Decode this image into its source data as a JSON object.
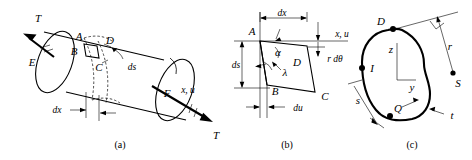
{
  "figure": {
    "ink_color": "#000000",
    "background_color": "#ffffff",
    "panels": [
      {
        "id": "a",
        "caption": "(a)",
        "description": "Thin-walled cylindrical tube under torque with a surface element ABCD",
        "labels": {
          "torque_left": "T",
          "torque_right": "T",
          "end_near": "E",
          "end_far": "F",
          "element_a": "A",
          "element_b": "B",
          "element_c": "C",
          "element_d": "D",
          "arc_length": "ds",
          "axial_length": "dx",
          "axis": "x, u"
        }
      },
      {
        "id": "b",
        "caption": "(b)",
        "description": "Deformed element ABCD in the developed x-s plane",
        "labels": {
          "corner_a": "A",
          "corner_b": "B",
          "corner_c": "C",
          "corner_d": "D",
          "axis": "x, u",
          "width": "dx",
          "height": "ds",
          "shear_angle": "α",
          "rotation_angle": "λ",
          "tangential_displacement": "r dθ",
          "axial_displacement": "du"
        }
      },
      {
        "id": "c",
        "caption": "(c)",
        "description": "Closed thin-walled cross-section with tangent, perpendicular distance r from shear center S",
        "labels": {
          "point_d": "D",
          "point_i": "I",
          "point_q": "Q",
          "point_s": "S",
          "axis_z": "z",
          "axis_y": "y",
          "perpendicular_distance": "r",
          "arc_coordinate": "s",
          "wall_thickness": "t"
        }
      }
    ]
  }
}
